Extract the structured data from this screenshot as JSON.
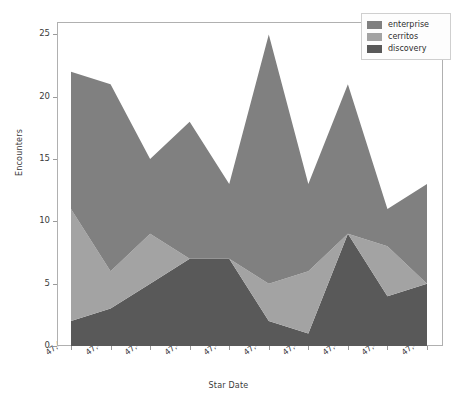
{
  "chart_data": {
    "type": "area",
    "stacked": true,
    "title": "",
    "xlabel": "Star Date",
    "ylabel": "Encounters",
    "x": [
      47457.1,
      47457.2,
      47457.3,
      47457.4,
      47457.5,
      47457.6,
      47457.7,
      47457.8,
      47457.9,
      47458.0
    ],
    "categories": [
      "47,457.1",
      "47,457.2",
      "47,457.3",
      "47,457.4",
      "47,457.5",
      "47,457.6",
      "47,457.7",
      "47,457.8",
      "47,457.9",
      "47,458.0"
    ],
    "xtick_labels": [
      "47,457.1",
      "47,457.2",
      "47,457.3",
      "47,457.4",
      "47,457.5",
      "47,457.6",
      "47,457.7",
      "47,457.8",
      "47,457.9",
      "47,458.0"
    ],
    "ytick_labels": [
      "0",
      "5",
      "10",
      "15",
      "20",
      "25"
    ],
    "yticks": [
      0,
      5,
      10,
      15,
      20,
      25
    ],
    "ylim": [
      0,
      26
    ],
    "xlim": [
      47457.1,
      47458.0
    ],
    "grid": false,
    "legend_position": "upper right",
    "series": [
      {
        "name": "discovery",
        "color": "#595959",
        "values": [
          2,
          3,
          5,
          7,
          7,
          2,
          1,
          9,
          4,
          5
        ]
      },
      {
        "name": "cerritos",
        "color": "#a3a3a3",
        "values": [
          9,
          3,
          4,
          0,
          0,
          3,
          5,
          0,
          4,
          0
        ]
      },
      {
        "name": "enterprise",
        "color": "#808080",
        "values": [
          11,
          15,
          6,
          11,
          6,
          20,
          7,
          12,
          3,
          8
        ]
      }
    ],
    "stack_order_bottom_to_top": [
      "discovery",
      "cerritos",
      "enterprise"
    ],
    "cumulative_totals": [
      22,
      21,
      15,
      18,
      13,
      25,
      13,
      21,
      11,
      13
    ],
    "band_upper_discovery": [
      2,
      3,
      5,
      7,
      7,
      2,
      1,
      9,
      4,
      5
    ],
    "band_upper_cerritos": [
      9,
      6,
      9,
      7,
      7,
      5,
      6,
      9,
      8,
      5
    ]
  },
  "legend": {
    "items": [
      {
        "label": "enterprise",
        "color": "#808080"
      },
      {
        "label": "cerritos",
        "color": "#a3a3a3"
      },
      {
        "label": "discovery",
        "color": "#595959"
      }
    ]
  },
  "axes": {
    "y_title": "Encounters",
    "x_title": "Star Date"
  }
}
